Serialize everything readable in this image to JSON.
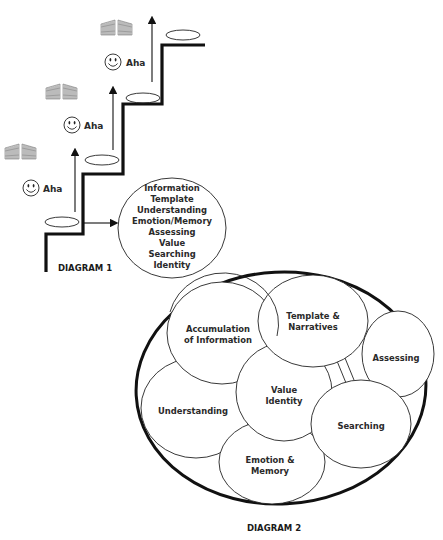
{
  "diagram1": {
    "caption": "DIAGRAM 1",
    "steps": [
      {
        "gate_icon": "gate-icon",
        "smiley_icon": "smiley-icon",
        "label": "Aha"
      },
      {
        "gate_icon": "gate-icon",
        "smiley_icon": "smiley-icon",
        "label": "Aha"
      },
      {
        "gate_icon": "gate-icon",
        "smiley_icon": "smiley-icon",
        "label": "Aha"
      }
    ],
    "circle_items": [
      "Information",
      "Template",
      "Understanding",
      "Emotion/Memory",
      "Assessing",
      "Value",
      "Searching",
      "Identity"
    ]
  },
  "diagram2": {
    "caption": "DIAGRAM 2",
    "circles": {
      "accumulation": {
        "line1": "Accumulation",
        "line2": "of Information"
      },
      "template": {
        "line1": "Template &",
        "line2": "Narratives"
      },
      "assessing": {
        "line1": "Assessing"
      },
      "value_identity": {
        "line1": "Value",
        "line2": "Identity"
      },
      "understanding": {
        "line1": "Understanding"
      },
      "searching": {
        "line1": "Searching"
      },
      "emotion": {
        "line1": "Emotion &",
        "line2": "Memory"
      }
    }
  },
  "colors": {
    "stroke": "#111111",
    "text": "#2a2a2a",
    "background": "#ffffff"
  }
}
